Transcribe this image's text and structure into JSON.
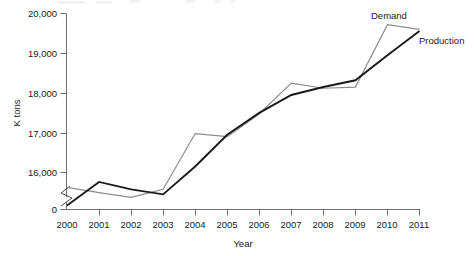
{
  "chart_data": {
    "type": "line",
    "title": "",
    "xlabel": "Year",
    "ylabel": "K tons",
    "x": [
      2000,
      2001,
      2002,
      2003,
      2004,
      2005,
      2006,
      2007,
      2008,
      2009,
      2010,
      2011
    ],
    "categories": [
      "2000",
      "2001",
      "2002",
      "2003",
      "2004",
      "2005",
      "2006",
      "2007",
      "2008",
      "2009",
      "2010",
      "2011"
    ],
    "series": [
      {
        "name": "Production",
        "color": "#1a1a1a",
        "values": [
          15020,
          15720,
          15500,
          15350,
          16150,
          16950,
          17500,
          17950,
          18150,
          18320,
          18950,
          19560
        ]
      },
      {
        "name": "Demand",
        "color": "#8c8c8c",
        "values": [
          15560,
          15400,
          15260,
          15500,
          16980,
          16900,
          17480,
          18250,
          18120,
          18150,
          19720,
          19600
        ]
      }
    ],
    "ylim": [
      15000,
      20000
    ],
    "y_ticks": [
      16000,
      17000,
      18000,
      19000,
      20000
    ],
    "y_tick_labels": [
      "16,000",
      "17,000",
      "18,000",
      "19,000",
      "20,000"
    ],
    "y_origin_label": "0",
    "y_axis_break": true,
    "grid": false,
    "legend": "inline-annotations",
    "annotations": [
      {
        "text": "Demand",
        "series": "Demand"
      },
      {
        "text": "Production",
        "series": "Production"
      }
    ]
  },
  "axis": {
    "y_title": "K tons",
    "x_title": "Year",
    "zero_label": "0"
  },
  "labels": {
    "demand": "Demand",
    "production": "Production"
  }
}
